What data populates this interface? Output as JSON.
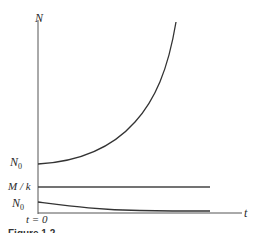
{
  "figure": {
    "axes": {
      "y_label": "N",
      "x_label": "t",
      "origin_label": "t = 0"
    },
    "curves": [
      {
        "name": "exponential-growth",
        "start_label": "N",
        "start_label_sub": "0",
        "description": "N0 rising exponentially"
      },
      {
        "name": "equilibrium",
        "label": "M / k",
        "description": "constant horizontal line at M/k"
      },
      {
        "name": "decay-to-equilibrium",
        "start_label": "N",
        "start_label_sub": "0",
        "description": "N0 decaying toward asymptote"
      }
    ],
    "caption": "Figure 1.2",
    "colors": {
      "axis": "#555555",
      "curve": "#333333",
      "background": "#ffffff"
    }
  }
}
